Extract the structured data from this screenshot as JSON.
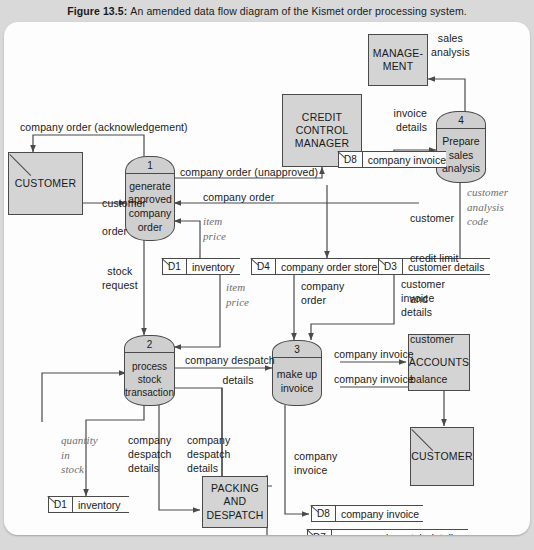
{
  "figure": {
    "number": "Figure 13.5:",
    "caption": "An amended data flow diagram of the Kismet order processing system."
  },
  "colors": {
    "page_background": "#d9d9d9",
    "panel_background": "#fdfdfd",
    "node_fill": "#d4d4d4",
    "process_fill": "#cfcfcf",
    "stroke": "#4a4a4a",
    "italic_label": "#6e6e6e"
  },
  "entities": [
    {
      "id": "customer_top",
      "label": "CUSTOMER",
      "duplicate_marker": true
    },
    {
      "id": "credit_control_manager",
      "label": "CREDIT\nCONTROL\nMANAGER",
      "duplicate_marker": false
    },
    {
      "id": "management",
      "label": "MANAGE-\nMENT",
      "duplicate_marker": false
    },
    {
      "id": "accounts",
      "label": "ACCOUNTS",
      "duplicate_marker": false
    },
    {
      "id": "customer_bottom",
      "label": "CUSTOMER",
      "duplicate_marker": true
    },
    {
      "id": "packing_and_despatch",
      "label": "PACKING\nAND\nDESPATCH",
      "duplicate_marker": false
    }
  ],
  "processes": [
    {
      "id": "p1",
      "number": "1",
      "label": "generate\napproved\ncompany\norder"
    },
    {
      "id": "p2",
      "number": "2",
      "label": "process\nstock\ntransaction"
    },
    {
      "id": "p3",
      "number": "3",
      "label": "make up\ninvoice"
    },
    {
      "id": "p4",
      "number": "4",
      "label": "Prepare\nsales\nanalysis"
    }
  ],
  "data_stores": [
    {
      "id": "d1_top",
      "code": "D1",
      "name": "inventory"
    },
    {
      "id": "d4",
      "code": "D4",
      "name": "company order store"
    },
    {
      "id": "d3",
      "code": "D3",
      "name": "customer details"
    },
    {
      "id": "d8_top",
      "code": "D8",
      "name": "company invoice"
    },
    {
      "id": "d1_bottom",
      "code": "D1",
      "name": "inventory"
    },
    {
      "id": "d8_bottom",
      "code": "D8",
      "name": "company invoice"
    },
    {
      "id": "d7",
      "code": "D7",
      "name": "company despatch details"
    }
  ],
  "flows": [
    {
      "id": "f_ack",
      "label": "company order (acknowledgement)",
      "style": "plain"
    },
    {
      "id": "f_customer_order",
      "label": "customer\norder",
      "style": "plain"
    },
    {
      "id": "f_order_unapproved",
      "label": "company order (unapproved)",
      "style": "plain"
    },
    {
      "id": "f_company_order_in",
      "label": "company order",
      "style": "plain"
    },
    {
      "id": "f_item_price_top",
      "label": "item\nprice",
      "style": "italic"
    },
    {
      "id": "f_item_price_mid",
      "label": "item\nprice",
      "style": "italic"
    },
    {
      "id": "f_stock_request",
      "label": "stock\nrequest",
      "style": "plain"
    },
    {
      "id": "f_credit_balance",
      "label": "customer\ncredit limit\nand\ncustomer\nbalance",
      "style": "mixed"
    },
    {
      "id": "f_analysis_code",
      "label": "customer\nanalysis\ncode",
      "style": "italic"
    },
    {
      "id": "f_sales_analysis",
      "label": "sales\nanalysis",
      "style": "plain"
    },
    {
      "id": "f_invoice_details",
      "label": "invoice\ndetails",
      "style": "plain"
    },
    {
      "id": "f_company_order_d4",
      "label": "company\norder",
      "style": "plain"
    },
    {
      "id": "f_customer_inv_details",
      "label": "customer\ninvoice\ndetails",
      "style": "plain"
    },
    {
      "id": "f_company_invoice_acc",
      "label": "company invoice",
      "style": "plain"
    },
    {
      "id": "f_company_invoice_cust",
      "label": "company invoice",
      "style": "plain"
    },
    {
      "id": "f_despatch_details",
      "label": "company despatch\ndetails",
      "style": "plain"
    },
    {
      "id": "f_quantity_in_stock",
      "label": "quantity\nin\nstock",
      "style": "italic"
    },
    {
      "id": "f_despatch_pack",
      "label": "company\ndespatch\ndetails",
      "style": "plain"
    },
    {
      "id": "f_despatch_store",
      "label": "company\ndespatch\ndetails",
      "style": "plain"
    },
    {
      "id": "f_company_invoice_d8",
      "label": "company\ninvoice",
      "style": "plain"
    }
  ],
  "label_text": {
    "ack": "company order (acknowledgement)",
    "customer_order_l1": "customer",
    "customer_order_l2": "order",
    "order_unapproved": "company order (unapproved)",
    "company_order": "company order",
    "item_price_top": "item\nprice",
    "item_price_mid": "item\nprice",
    "stock_request": "stock\nrequest",
    "credit_l1": "customer",
    "credit_l2": "credit limit",
    "credit_l3": "and",
    "credit_l4": "customer",
    "credit_l5": "balance",
    "analysis_code": "customer\nanalysis\ncode",
    "sales_analysis": "sales\nanalysis",
    "invoice_details": "invoice\ndetails",
    "company_order_d4": "company\norder",
    "customer_invoice_details": "customer\ninvoice\ndetails",
    "company_invoice_acc": "company invoice",
    "company_invoice_cust": "company invoice",
    "company_despatch": "company despatch",
    "details": "details",
    "quantity_in_stock": "quantity\nin\nstock",
    "despatch_pack": "company\ndespatch\ndetails",
    "despatch_store": "company\ndespatch\ndetails",
    "company_invoice_d8": "company\ninvoice"
  }
}
